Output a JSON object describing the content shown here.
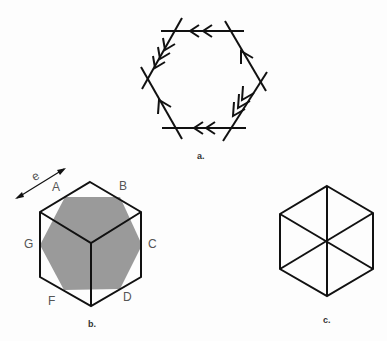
{
  "figures": {
    "a": {
      "caption": "a.",
      "description": "hexagon of crossing lines with arrowheads"
    },
    "b": {
      "caption": "b.",
      "dimension_label": "e",
      "vertex_labels": {
        "A": "A",
        "B": "B",
        "C": "C",
        "D": "D",
        "F": "F",
        "G": "G"
      },
      "shade_color": "#9a9a9a"
    },
    "c": {
      "caption": "c.",
      "description": "hexagon divided into six triangles"
    }
  },
  "colors": {
    "line": "#111111",
    "shade": "#9a9a9a",
    "background": "#fdfdfd"
  }
}
